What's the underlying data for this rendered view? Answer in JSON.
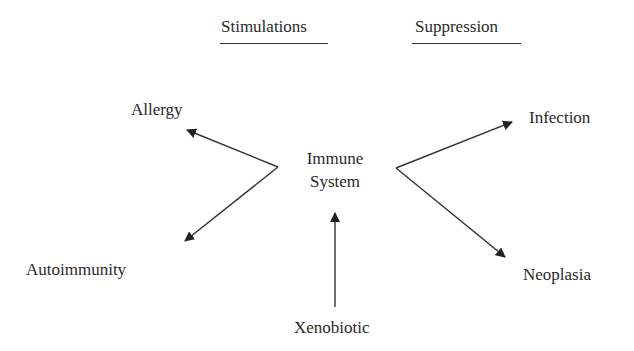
{
  "headers": {
    "left": "Stimulations",
    "right": "Suppression"
  },
  "nodes": {
    "center_line1": "Immune",
    "center_line2": "System",
    "allergy": "Allergy",
    "autoimmunity": "Autoimmunity",
    "infection": "Infection",
    "neoplasia": "Neoplasia",
    "xenobiotic": "Xenobiotic"
  },
  "edges": [
    {
      "from": "Immune System (left vertex)",
      "to": "Allergy",
      "group": "Stimulations"
    },
    {
      "from": "Immune System (left vertex)",
      "to": "Autoimmunity",
      "group": "Stimulations"
    },
    {
      "from": "Immune System (right vertex)",
      "to": "Infection",
      "group": "Suppression"
    },
    {
      "from": "Immune System (right vertex)",
      "to": "Neoplasia",
      "group": "Suppression"
    },
    {
      "from": "Xenobiotic",
      "to": "Immune System"
    }
  ],
  "colors": {
    "line": "#333333",
    "text": "#2a2a2a",
    "background": "#ffffff"
  }
}
